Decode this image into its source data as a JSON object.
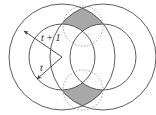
{
  "figure": {
    "background_color": "#ffffff",
    "stroke_color": "#4a4a4a",
    "dotted_stroke_color": "#8a8a8a",
    "shade_fill": "#a8a8a8",
    "label_color": "#1a1a1a",
    "width": 156,
    "height": 115
  },
  "labels": {
    "outer_radius": "t + 1",
    "inner_radius": "t"
  },
  "geometry": {
    "left_center": {
      "x": 62,
      "y": 57
    },
    "right_center": {
      "x": 103,
      "y": 57
    },
    "outer_radius": 53,
    "inner_radius": 33,
    "dotted_top_center": {
      "x": 83,
      "y": 26
    },
    "dotted_bottom_center": {
      "x": 83,
      "y": 90
    },
    "dotted_radius": 20
  },
  "annotations": [
    {
      "name": "outer-radius-arrow",
      "label": "t + 1",
      "from": {
        "x": 62,
        "y": 57
      },
      "to": {
        "x": 22,
        "y": 30
      }
    },
    {
      "name": "inner-radius-arrow",
      "label": "t",
      "from": {
        "x": 62,
        "y": 57
      },
      "to": {
        "x": 36,
        "y": 81
      }
    }
  ],
  "shaded_regions": [
    {
      "name": "top-intersection-region",
      "fill": "#a8a8a8"
    },
    {
      "name": "bottom-intersection-region",
      "fill": "#a8a8a8"
    }
  ]
}
